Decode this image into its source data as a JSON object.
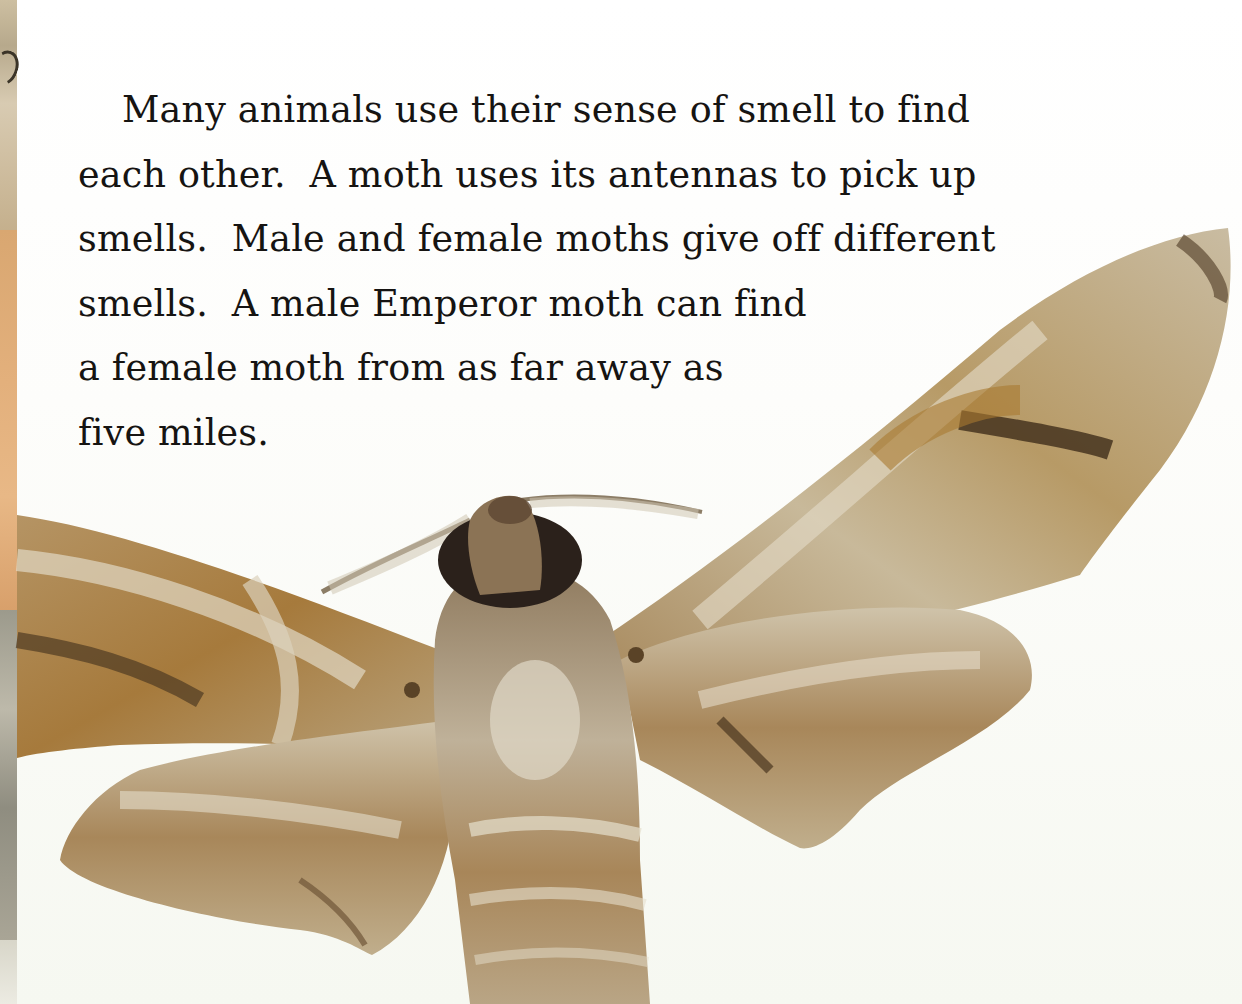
{
  "page": {
    "paragraph_lines": [
      "Many animals use their sense of smell to find",
      "each other.  A moth uses its antennas to pick up",
      "smells.  Male and female moths give off different",
      "smells.  A male Emperor moth can find",
      "a female moth from as far away as",
      "five miles."
    ],
    "illustration": {
      "subject": "moth-photograph",
      "colors": {
        "wing_tan": "#b9a88a",
        "wing_brown": "#a47836",
        "wing_light": "#ddd4c0",
        "wing_dark": "#5a4327",
        "eye": "#2b211b",
        "background": "#fbfcf8"
      }
    },
    "left_strip": {
      "subject": "photo-collage-edge"
    }
  }
}
